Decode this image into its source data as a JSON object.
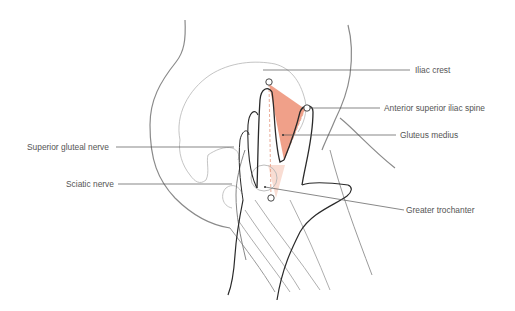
{
  "figure": {
    "colors": {
      "muscle_fill": "#f0a089",
      "muscle_fill_light": "#f8d5c8",
      "outline_dark": "#2a2a2a",
      "outline_light": "#9a9a9a",
      "leader_line": "#555555",
      "label_text": "#555555"
    },
    "labels": {
      "iliac_crest": "Iliac crest",
      "asis": "Anterior superior iliac spine",
      "gluteus_medius": "Gluteus medius",
      "superior_gluteal_nerve": "Superior gluteal nerve",
      "sciatic_nerve": "Sciatic nerve",
      "greater_trochanter": "Greater trochanter"
    }
  }
}
